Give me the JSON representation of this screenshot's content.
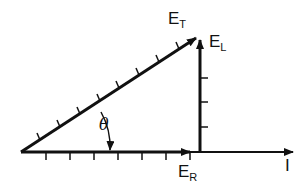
{
  "diagram": {
    "labels": {
      "et": {
        "main": "E",
        "sub": "T"
      },
      "el": {
        "main": "E",
        "sub": "L"
      },
      "er": {
        "main": "E",
        "sub": "R"
      },
      "i": "I",
      "theta": "θ"
    },
    "colors": {
      "stroke": "#111111",
      "background": "#ffffff"
    }
  }
}
